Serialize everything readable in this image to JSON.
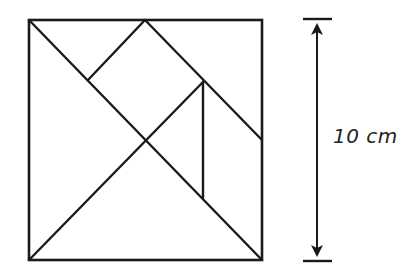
{
  "figure": {
    "type": "tangram-square",
    "square": {
      "x": 29,
      "y": 20,
      "size": 233
    },
    "lines": [
      {
        "name": "main-diagonal",
        "x1": 29,
        "y1": 20,
        "x2": 262,
        "y2": 260
      },
      {
        "name": "anti-diagonal-lower",
        "x1": 29,
        "y1": 260,
        "x2": 203,
        "y2": 82
      },
      {
        "name": "parallelogram-top-left-edge",
        "x1": 88,
        "y1": 80,
        "x2": 145,
        "y2": 20
      },
      {
        "name": "parallelogram-top-right-edge",
        "x1": 145,
        "y1": 20,
        "x2": 262,
        "y2": 140
      },
      {
        "name": "small-triangle-vertical",
        "x1": 203,
        "y1": 82,
        "x2": 203,
        "y2": 198
      }
    ],
    "pieces_count": 7
  },
  "dimension": {
    "label": "10 cm",
    "value": 10,
    "unit": "cm",
    "top_tick": {
      "x1": 303,
      "x2": 332,
      "y": 19
    },
    "bottom_tick": {
      "x1": 303,
      "x2": 332,
      "y": 261
    },
    "arrow_x": 317
  }
}
